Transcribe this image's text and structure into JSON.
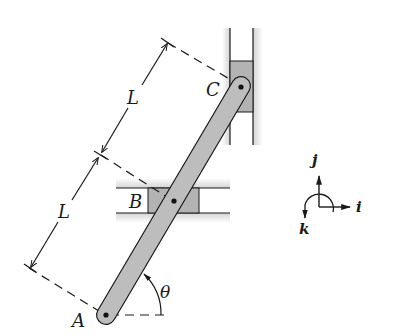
{
  "figure": {
    "points": {
      "A": "A",
      "B": "B",
      "C": "C"
    },
    "dimensions": {
      "upper_length": "L",
      "lower_length": "L"
    },
    "angle": "θ",
    "axes": {
      "i": "i",
      "j": "j",
      "k": "k"
    },
    "colors": {
      "bar_fill": "#bdbdbd",
      "slider_fill": "#b3b3b3",
      "line": "#1a1a1a",
      "guide_shade": "#d9d9d9"
    }
  }
}
